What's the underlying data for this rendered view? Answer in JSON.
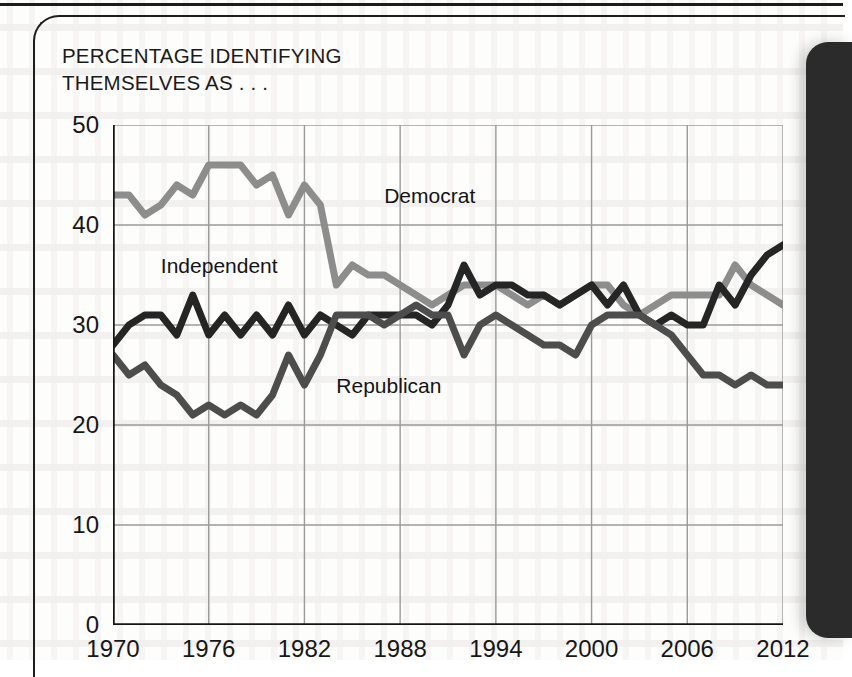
{
  "figure": {
    "title": "PERCENTAGE IDENTIFYING\nTHEMSELVES AS . . ."
  },
  "chart_data": {
    "type": "line",
    "title": "PERCENTAGE IDENTIFYING THEMSELVES AS . . .",
    "xlabel": "",
    "ylabel": "",
    "xlim": [
      1970,
      2012
    ],
    "ylim": [
      0,
      50
    ],
    "yticks": [
      0,
      10,
      20,
      30,
      40,
      50
    ],
    "xticks": [
      1970,
      1976,
      1982,
      1988,
      1994,
      2000,
      2006,
      2012
    ],
    "grid": true,
    "legend": "inline-annotations",
    "x": [
      1970,
      1971,
      1972,
      1973,
      1974,
      1975,
      1976,
      1977,
      1978,
      1979,
      1980,
      1981,
      1982,
      1983,
      1984,
      1985,
      1986,
      1987,
      1988,
      1989,
      1990,
      1991,
      1992,
      1993,
      1994,
      1995,
      1996,
      1997,
      1998,
      1999,
      2000,
      2001,
      2002,
      2003,
      2004,
      2005,
      2006,
      2007,
      2008,
      2009,
      2010,
      2011,
      2012
    ],
    "series": [
      {
        "name": "Democrat",
        "color": "#8d8d8d",
        "values": [
          43,
          43,
          41,
          42,
          44,
          43,
          46,
          46,
          46,
          44,
          45,
          41,
          44,
          42,
          34,
          36,
          35,
          35,
          34,
          33,
          32,
          33,
          34,
          34,
          34,
          33,
          32,
          33,
          32,
          33,
          34,
          34,
          32,
          31,
          32,
          33,
          33,
          33,
          33,
          36,
          34,
          33,
          32
        ]
      },
      {
        "name": "Independent",
        "color": "#252525",
        "values": [
          28,
          30,
          31,
          31,
          29,
          33,
          29,
          31,
          29,
          31,
          29,
          32,
          29,
          31,
          30,
          29,
          31,
          31,
          31,
          31,
          30,
          32,
          36,
          33,
          34,
          34,
          33,
          33,
          32,
          33,
          34,
          32,
          34,
          31,
          30,
          31,
          30,
          30,
          34,
          32,
          35,
          37,
          38
        ]
      },
      {
        "name": "Republican",
        "color": "#4d4d4d",
        "values": [
          27,
          25,
          26,
          24,
          23,
          21,
          22,
          21,
          22,
          21,
          23,
          27,
          24,
          27,
          31,
          31,
          31,
          30,
          31,
          32,
          31,
          31,
          27,
          30,
          31,
          30,
          29,
          28,
          28,
          27,
          30,
          31,
          31,
          31,
          30,
          29,
          27,
          25,
          25,
          24,
          25,
          24,
          24
        ]
      }
    ],
    "annotations": [
      {
        "text": "Democrat",
        "x": 1987,
        "y": 43
      },
      {
        "text": "Independent",
        "x": 1973,
        "y": 36
      },
      {
        "text": "Republican",
        "x": 1984,
        "y": 24
      }
    ]
  },
  "axis": {
    "y_labels": [
      "50",
      "40",
      "30",
      "20",
      "10",
      "0"
    ],
    "x_labels": [
      "1970",
      "1976",
      "1982",
      "1988",
      "1994",
      "2000",
      "2006",
      "2012"
    ]
  },
  "colors": {
    "democrat": "#8d8d8d",
    "independent": "#252525",
    "republican": "#4d4d4d",
    "axis": "#151515",
    "grid": "#9a9a9a"
  }
}
